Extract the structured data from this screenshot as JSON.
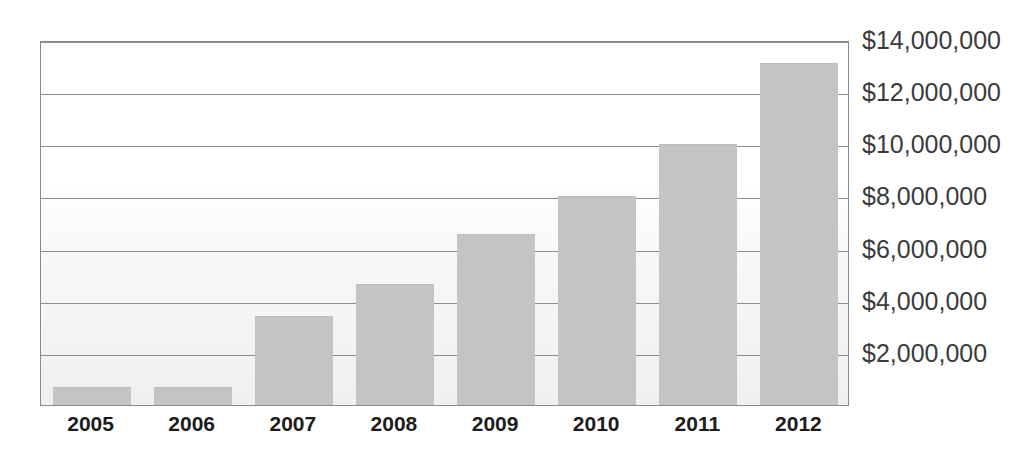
{
  "chart_data": {
    "type": "bar",
    "title": "",
    "subtitle": "",
    "xlabel": "",
    "ylabel": "",
    "categories": [
      "2005",
      "2006",
      "2007",
      "2008",
      "2009",
      "2010",
      "2011",
      "2012"
    ],
    "values": [
      700000,
      700000,
      3400000,
      4650000,
      6550000,
      8000000,
      10000000,
      13100000
    ],
    "series": [
      {
        "name": "",
        "values": [
          700000,
          700000,
          3400000,
          4650000,
          6550000,
          8000000,
          10000000,
          13100000
        ]
      }
    ],
    "ylim": [
      0,
      14000000
    ],
    "y_tick_values": [
      2000000,
      4000000,
      6000000,
      8000000,
      10000000,
      12000000,
      14000000
    ],
    "y_tick_labels": [
      "$2,000,000",
      "$4,000,000",
      "$6,000,000",
      "$8,000,000",
      "$10,000,000",
      "$12,000,000",
      "$14,000,000"
    ],
    "grid": true,
    "legend": false,
    "legend_position": "none",
    "bar_color": "#c4c4c4",
    "gridline_color": "#8d8d8d",
    "axis_color": "#8a8a8a",
    "label_color": "#3b3b3b",
    "category_label_color": "#1c1c1c",
    "plot_background": "#ffffff"
  }
}
